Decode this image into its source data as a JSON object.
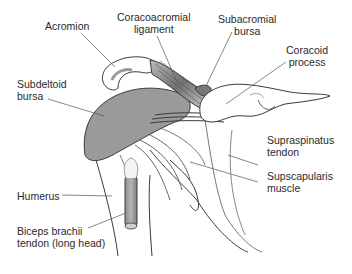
{
  "diagram": {
    "labels": [
      {
        "id": "acromion",
        "lines": [
          "Acromion"
        ]
      },
      {
        "id": "coracoacromial-ligament",
        "lines": [
          "Coracoacromial",
          "ligament"
        ]
      },
      {
        "id": "subacromial-bursa",
        "lines": [
          "Subacromial",
          "bursa"
        ]
      },
      {
        "id": "coracoid-process",
        "lines": [
          "Coracoid",
          "process"
        ]
      },
      {
        "id": "subdeltoid-bursa",
        "lines": [
          "Subdeltoid",
          "bursa"
        ]
      },
      {
        "id": "supraspinatus-tendon",
        "lines": [
          "Supraspinatus",
          "tendon"
        ]
      },
      {
        "id": "subscapularis-muscle",
        "lines": [
          "Supscapularis",
          "muscle"
        ]
      },
      {
        "id": "humerus",
        "lines": [
          "Humerus"
        ]
      },
      {
        "id": "biceps-tendon",
        "lines": [
          "Biceps brachii",
          "tendon (long head)"
        ]
      }
    ],
    "colors": {
      "line": "#3a3a3a",
      "bursa_fill": "#9a9a9a",
      "ligament_fill": "#7a7a7a",
      "leader": "#555555"
    }
  }
}
